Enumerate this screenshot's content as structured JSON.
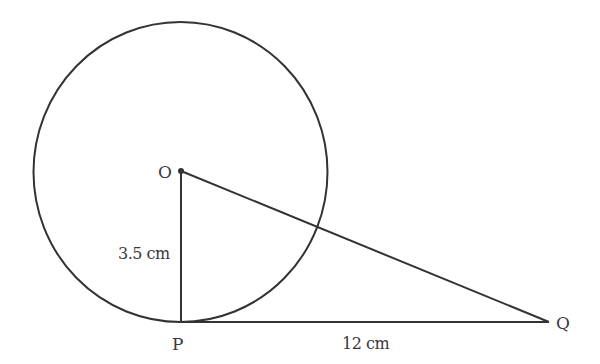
{
  "diagram": {
    "type": "geometry",
    "points": {
      "O": {
        "label": "O",
        "x": 181,
        "y": 171
      },
      "P": {
        "label": "P",
        "x": 181,
        "y": 322
      },
      "Q": {
        "label": "Q",
        "x": 549,
        "y": 322
      }
    },
    "circle": {
      "cx": 180.5,
      "cy": 172,
      "rx": 147,
      "ry": 150
    },
    "measurements": {
      "OP": "3.5 cm",
      "PQ": "12 cm"
    },
    "colors": {
      "stroke": "#333333",
      "text": "#3a3a3a",
      "background": "#ffffff"
    }
  }
}
